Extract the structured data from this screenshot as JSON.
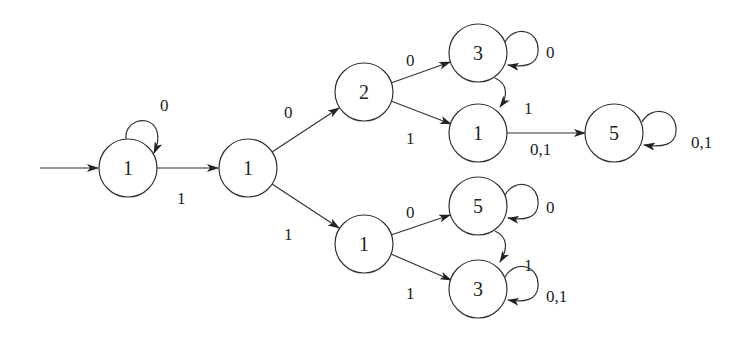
{
  "diagram": {
    "type": "state-machine",
    "start_state": "A",
    "nodes": [
      {
        "id": "A",
        "label": "1",
        "x": 128,
        "y": 168
      },
      {
        "id": "B",
        "label": "1",
        "x": 248,
        "y": 168
      },
      {
        "id": "C",
        "label": "2",
        "x": 364,
        "y": 92
      },
      {
        "id": "D",
        "label": "3",
        "x": 478,
        "y": 53
      },
      {
        "id": "E",
        "label": "1",
        "x": 478,
        "y": 133
      },
      {
        "id": "F",
        "label": "5",
        "x": 614,
        "y": 133
      },
      {
        "id": "G",
        "label": "1",
        "x": 364,
        "y": 244
      },
      {
        "id": "H",
        "label": "5",
        "x": 478,
        "y": 206
      },
      {
        "id": "I",
        "label": "3",
        "x": 478,
        "y": 289
      }
    ],
    "edges": [
      {
        "from": "A",
        "to": "A",
        "label": "0"
      },
      {
        "from": "A",
        "to": "B",
        "label": "1"
      },
      {
        "from": "B",
        "to": "C",
        "label": "0"
      },
      {
        "from": "B",
        "to": "G",
        "label": "1"
      },
      {
        "from": "C",
        "to": "D",
        "label": "0"
      },
      {
        "from": "C",
        "to": "E",
        "label": "1"
      },
      {
        "from": "D",
        "to": "D",
        "label": "0"
      },
      {
        "from": "D",
        "to": "E",
        "label": "1"
      },
      {
        "from": "E",
        "to": "F",
        "label": "0,1"
      },
      {
        "from": "F",
        "to": "F",
        "label": "0,1"
      },
      {
        "from": "G",
        "to": "H",
        "label": "0"
      },
      {
        "from": "G",
        "to": "I",
        "label": "1"
      },
      {
        "from": "H",
        "to": "H",
        "label": "0"
      },
      {
        "from": "H",
        "to": "I",
        "label": "1"
      },
      {
        "from": "I",
        "to": "I",
        "label": "0,1"
      }
    ]
  },
  "labels": {
    "nA": "1",
    "nB": "1",
    "nC": "2",
    "nD": "3",
    "nE": "1",
    "nF": "5",
    "nG": "1",
    "nH": "5",
    "nI": "3",
    "eAA": "0",
    "eAB": "1",
    "eBC": "0",
    "eBG": "1",
    "eCD": "0",
    "eCE": "1",
    "eDD": "0",
    "eDE": "1",
    "eEF": "0,1",
    "eFF": "0,1",
    "eGH": "0",
    "eGI": "1",
    "eHH": "0",
    "eHI": "1",
    "eII": "0,1"
  }
}
